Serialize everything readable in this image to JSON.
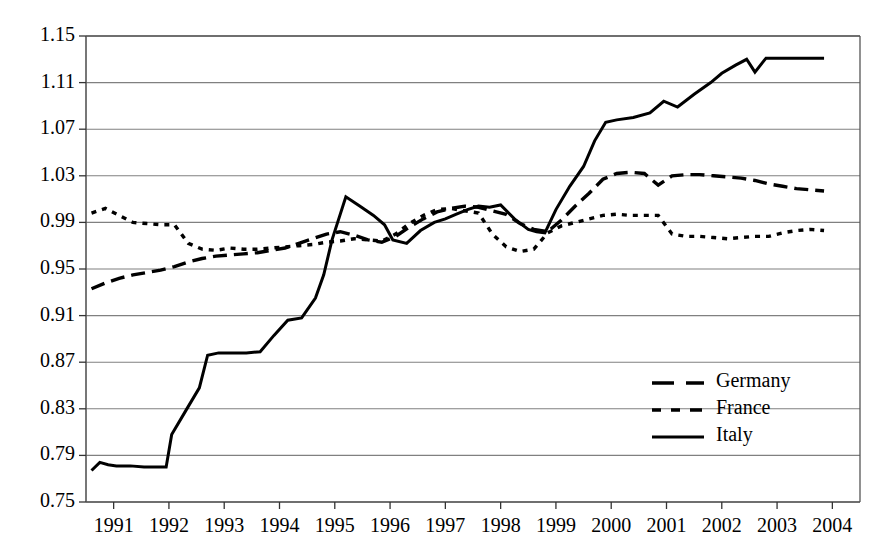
{
  "chart_data": {
    "type": "line",
    "title": "",
    "xlabel": "",
    "ylabel": "",
    "xlim": [
      1990.5,
      2004.5
    ],
    "ylim": [
      0.75,
      1.15
    ],
    "grid": true,
    "legend_position": "center-right",
    "ytick_labels": [
      "1.15",
      "1.11",
      "1.07",
      "1.03",
      "0.99",
      "0.95",
      "0.91",
      "0.87",
      "0.83",
      "0.79",
      "0.75"
    ],
    "ytick_values": [
      1.15,
      1.11,
      1.07,
      1.03,
      0.99,
      0.95,
      0.91,
      0.87,
      0.83,
      0.79,
      0.75
    ],
    "xtick_labels": [
      "1991",
      "1992",
      "1993",
      "1994",
      "1995",
      "1996",
      "1997",
      "1998",
      "1999",
      "2000",
      "2001",
      "2002",
      "2003",
      "2004"
    ],
    "xtick_values": [
      1991,
      1992,
      1993,
      1994,
      1995,
      1996,
      1997,
      1998,
      1999,
      2000,
      2001,
      2002,
      2003,
      2004
    ],
    "series": [
      {
        "name": "Germany",
        "style": "long-dash",
        "color": "#000000",
        "x": [
          1990.6,
          1990.85,
          1991.1,
          1991.35,
          1991.6,
          1991.85,
          1992.1,
          1992.35,
          1992.6,
          1992.85,
          1993.1,
          1993.35,
          1993.6,
          1993.85,
          1994.1,
          1994.35,
          1994.6,
          1994.85,
          1995.1,
          1995.35,
          1995.6,
          1995.85,
          1996.1,
          1996.35,
          1996.6,
          1996.85,
          1997.1,
          1997.35,
          1997.6,
          1997.85,
          1998.1,
          1998.35,
          1998.6,
          1998.85,
          1999.1,
          1999.35,
          1999.6,
          1999.85,
          2000.1,
          2000.35,
          2000.6,
          2000.85,
          2001.1,
          2001.35,
          2001.6,
          2001.85,
          2002.1,
          2002.35,
          2002.6,
          2002.85,
          2003.1,
          2003.35,
          2003.6,
          2003.85
        ],
        "y": [
          0.933,
          0.938,
          0.942,
          0.945,
          0.947,
          0.949,
          0.952,
          0.956,
          0.959,
          0.961,
          0.962,
          0.963,
          0.964,
          0.966,
          0.968,
          0.972,
          0.976,
          0.98,
          0.982,
          0.979,
          0.975,
          0.973,
          0.978,
          0.986,
          0.993,
          0.999,
          1.002,
          1.004,
          1.003,
          1.0,
          0.997,
          0.989,
          0.984,
          0.982,
          0.992,
          1.004,
          1.015,
          1.027,
          1.032,
          1.033,
          1.032,
          1.022,
          1.03,
          1.031,
          1.031,
          1.03,
          1.029,
          1.028,
          1.026,
          1.023,
          1.021,
          1.019,
          1.018,
          1.017
        ]
      },
      {
        "name": "France",
        "style": "short-dash",
        "color": "#000000",
        "x": [
          1990.6,
          1990.85,
          1991.1,
          1991.35,
          1991.6,
          1991.85,
          1992.1,
          1992.35,
          1992.6,
          1992.85,
          1993.1,
          1993.35,
          1993.6,
          1993.85,
          1994.1,
          1994.35,
          1994.6,
          1994.85,
          1995.1,
          1995.35,
          1995.6,
          1995.85,
          1996.1,
          1996.35,
          1996.6,
          1996.85,
          1997.1,
          1997.35,
          1997.6,
          1997.85,
          1998.1,
          1998.35,
          1998.6,
          1998.85,
          1999.1,
          1999.35,
          1999.6,
          1999.85,
          2000.1,
          2000.35,
          2000.6,
          2000.85,
          2001.1,
          2001.35,
          2001.6,
          2001.85,
          2002.1,
          2002.35,
          2002.6,
          2002.85,
          2003.1,
          2003.35,
          2003.6,
          2003.85
        ],
        "y": [
          0.998,
          1.002,
          0.996,
          0.99,
          0.989,
          0.988,
          0.988,
          0.972,
          0.967,
          0.966,
          0.968,
          0.967,
          0.967,
          0.968,
          0.969,
          0.97,
          0.971,
          0.973,
          0.974,
          0.976,
          0.975,
          0.974,
          0.98,
          0.989,
          0.996,
          1.001,
          1.002,
          1.0,
          0.998,
          0.98,
          0.969,
          0.965,
          0.967,
          0.981,
          0.987,
          0.99,
          0.993,
          0.996,
          0.997,
          0.996,
          0.996,
          0.996,
          0.98,
          0.978,
          0.978,
          0.977,
          0.976,
          0.977,
          0.978,
          0.978,
          0.981,
          0.983,
          0.984,
          0.983
        ]
      },
      {
        "name": "Italy",
        "style": "solid",
        "color": "#000000",
        "x": [
          1990.6,
          1990.75,
          1990.9,
          1991.05,
          1991.3,
          1991.55,
          1991.8,
          1991.95,
          1992.05,
          1992.3,
          1992.55,
          1992.7,
          1992.9,
          1993.15,
          1993.4,
          1993.65,
          1993.9,
          1994.15,
          1994.4,
          1994.65,
          1994.8,
          1994.95,
          1995.2,
          1995.45,
          1995.7,
          1995.9,
          1996.05,
          1996.3,
          1996.55,
          1996.8,
          1997.0,
          1997.2,
          1997.4,
          1997.6,
          1997.8,
          1998.0,
          1998.25,
          1998.5,
          1998.65,
          1998.8,
          1999.0,
          1999.25,
          1999.5,
          1999.7,
          1999.9,
          2000.1,
          2000.4,
          2000.7,
          2000.95,
          2001.2,
          2001.5,
          2001.8,
          2002.0,
          2002.25,
          2002.45,
          2002.6,
          2002.8,
          2003.1,
          2003.5,
          2003.85
        ],
        "y": [
          0.777,
          0.784,
          0.782,
          0.781,
          0.781,
          0.78,
          0.78,
          0.78,
          0.808,
          0.828,
          0.848,
          0.876,
          0.878,
          0.878,
          0.878,
          0.879,
          0.893,
          0.906,
          0.908,
          0.925,
          0.945,
          0.975,
          1.012,
          1.004,
          0.996,
          0.988,
          0.975,
          0.972,
          0.983,
          0.99,
          0.993,
          0.997,
          1.001,
          1.004,
          1.003,
          1.005,
          0.993,
          0.984,
          0.982,
          0.981,
          1.001,
          1.021,
          1.038,
          1.06,
          1.076,
          1.078,
          1.08,
          1.084,
          1.094,
          1.089,
          1.1,
          1.11,
          1.118,
          1.125,
          1.13,
          1.119,
          1.131,
          1.131,
          1.131,
          1.131
        ]
      }
    ]
  },
  "legend": {
    "items": [
      {
        "label": "Germany",
        "style": "long-dash"
      },
      {
        "label": "France",
        "style": "short-dash"
      },
      {
        "label": "Italy",
        "style": "solid"
      }
    ]
  },
  "colors": {
    "axis": "#000000",
    "grid": "#808080",
    "series": "#000000",
    "background": "#ffffff"
  }
}
